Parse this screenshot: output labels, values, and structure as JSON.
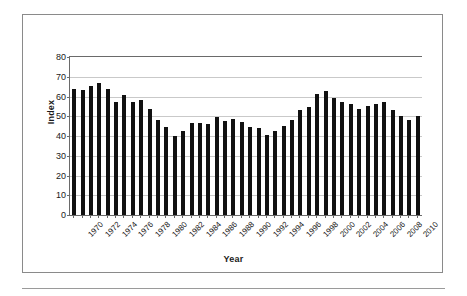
{
  "figure": {
    "y_axis_title": "Index",
    "x_axis_title": "Year",
    "bar_color": "#111111",
    "gridline_color": "#c9c9c9",
    "axis_color": "#6a6a6a",
    "frame_color": "#8a8a8a"
  },
  "chart_data": {
    "type": "bar",
    "title": "",
    "xlabel": "Year",
    "ylabel": "Index",
    "ylim": [
      0,
      80
    ],
    "ytick_values": [
      0,
      10,
      20,
      30,
      40,
      50,
      60,
      70,
      80
    ],
    "ytick_labels": [
      "0",
      "10",
      "20",
      "30",
      "40",
      "50",
      "60",
      "70",
      "80"
    ],
    "grid": true,
    "legend": false,
    "xtick_labels": [
      "1970",
      "1972",
      "1974",
      "1976",
      "1978",
      "1980",
      "1982",
      "1984",
      "1986",
      "1988",
      "1990",
      "1992",
      "1994",
      "1996",
      "1998",
      "2000",
      "2002",
      "2004",
      "2006",
      "2008",
      "2010"
    ],
    "xtick_interval": 2,
    "categories": [
      "1970",
      "1971",
      "1972",
      "1973",
      "1974",
      "1975",
      "1976",
      "1977",
      "1978",
      "1979",
      "1980",
      "1981",
      "1982",
      "1983",
      "1984",
      "1985",
      "1986",
      "1987",
      "1988",
      "1989",
      "1990",
      "1991",
      "1992",
      "1993",
      "1994",
      "1995",
      "1996",
      "1997",
      "1998",
      "1999",
      "2000",
      "2001",
      "2002",
      "2003",
      "2004",
      "2005",
      "2006",
      "2007",
      "2008",
      "2009",
      "2010",
      "2011"
    ],
    "values": [
      64.0,
      63.2,
      65.2,
      66.8,
      63.8,
      57.3,
      60.7,
      57.4,
      58.0,
      53.5,
      48.0,
      44.6,
      40.0,
      42.4,
      46.4,
      46.5,
      46.0,
      49.6,
      47.6,
      48.4,
      47.0,
      44.8,
      44.0,
      40.6,
      42.6,
      45.1,
      48.0,
      53.4,
      54.6,
      61.3,
      62.6,
      59.1,
      57.2,
      56.2,
      53.6,
      55.0,
      56.2,
      57.0,
      53.2,
      50.1,
      48.3,
      50.2
    ]
  }
}
